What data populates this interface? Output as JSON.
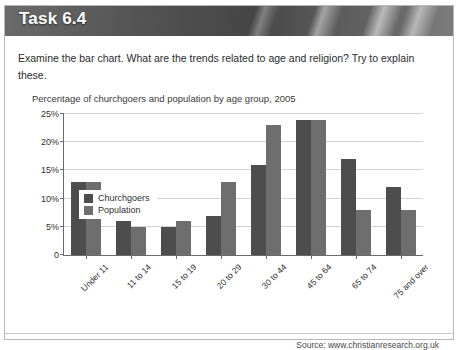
{
  "banner": {
    "title": "Task 6.4"
  },
  "instruction": "Examine the bar chart. What are the trends related to age and religion? Try to explain these.",
  "source": {
    "prefix": "Source:",
    "url": "www.christianresearch.org.uk",
    "full": "Source: www.christianresearch.org.uk"
  },
  "colors": {
    "churchgoers": "#4d4d4d",
    "population": "#6e6e6e",
    "banner": "#6f6f6f",
    "grid": "#d3d3d3",
    "axis": "#6a6a6a"
  },
  "chart_data": {
    "type": "bar",
    "title": "Percentage of churchgoers and population by age group, 2005",
    "xlabel": "",
    "ylabel": "",
    "ylim": [
      0,
      25
    ],
    "yticks": [
      0,
      5,
      10,
      15,
      20,
      25
    ],
    "ytick_labels": [
      "0",
      "5%",
      "10%",
      "15%",
      "20%",
      "25%"
    ],
    "grid": true,
    "legend_position": "top-left-inside",
    "categories": [
      "Under 11",
      "11 to 14",
      "15 to 19",
      "20 to 29",
      "30 to 44",
      "45 to 64",
      "65 to 74",
      "75 and over"
    ],
    "series": [
      {
        "name": "Churchgoers",
        "values": [
          13,
          6,
          5,
          7,
          16,
          24,
          17,
          12
        ]
      },
      {
        "name": "Population",
        "values": [
          13,
          5,
          6,
          13,
          23,
          24,
          8,
          8
        ]
      }
    ]
  }
}
